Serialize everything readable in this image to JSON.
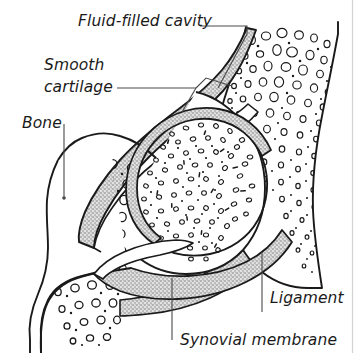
{
  "figure": {
    "background_color": "#ffffff",
    "ink_color": "#1a1a1a",
    "cartilage_fill": "#a8a8a8",
    "ligament_fill": "#b0b0b0",
    "rule_color": "#cfcfcf"
  },
  "labels": {
    "fluid_filled_cavity": "Fluid-filled cavity",
    "smooth_line1": "Smooth",
    "smooth_line2": "cartilage",
    "bone": "Bone",
    "ligament": "Ligament",
    "synovial_membrane": "Synovial membrane"
  },
  "structures": {
    "upper_bone": "upper bone shaft with spongy trabecular texture",
    "lower_bone": "lower bone head with spongy trabecular texture",
    "articular_cartilage": "smooth grey cartilage band lining joint surfaces",
    "joint_cavity": "fluid-filled cavity between cartilage surfaces",
    "ligament_band": "grey stippled ligament wrapping the joint capsule",
    "synovial_membrane_band": "grey stippled membrane lining the capsule"
  }
}
